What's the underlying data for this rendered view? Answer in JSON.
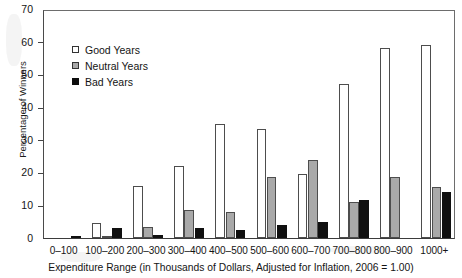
{
  "chart_data": {
    "type": "bar",
    "title": "",
    "xlabel": "Expenditure Range (in Thousands of Dollars, Adjusted for Inflation, 2006 = 1.00)",
    "ylabel": "Percentage of Winners",
    "ylim": [
      0,
      70
    ],
    "yticks": [
      0,
      10,
      20,
      30,
      40,
      50,
      60,
      70
    ],
    "grid": false,
    "legend_position": "upper-left-inside",
    "categories": [
      "0–100",
      "100–200",
      "200–300",
      "300–400",
      "400–500",
      "500–600",
      "600–700",
      "700–800",
      "800–900",
      "1000+"
    ],
    "series": [
      {
        "name": "Good Years",
        "color": "#ffffff",
        "values": [
          0,
          4.5,
          16,
          22,
          35,
          33.3,
          19.5,
          47,
          58,
          59
        ]
      },
      {
        "name": "Neutral Years",
        "color": "#a9a9a9",
        "values": [
          0,
          0.5,
          3.5,
          8.5,
          8,
          18.5,
          24,
          11,
          18.5,
          15.5
        ]
      },
      {
        "name": "Bad Years",
        "color": "#0d0d0d",
        "values": [
          0.6,
          3,
          1,
          3,
          2.5,
          4,
          5,
          11.5,
          0,
          14
        ]
      }
    ]
  },
  "legend": {
    "items": [
      {
        "label": "Good Years"
      },
      {
        "label": "Neutral Years"
      },
      {
        "label": "Bad Years"
      }
    ]
  },
  "axes": {
    "y_tick_labels": [
      "70",
      "60",
      "50",
      "40",
      "30",
      "20",
      "10",
      "0"
    ],
    "y_title": "Percentage of Winners",
    "x_title": "Expenditure Range (in Thousands of Dollars, Adjusted for Inflation, 2006 = 1.00)",
    "x_tick_labels": [
      "0–100",
      "100–200",
      "200–300",
      "300–400",
      "400–500",
      "500–600",
      "600–700",
      "700–800",
      "800–900",
      "1000+"
    ]
  }
}
